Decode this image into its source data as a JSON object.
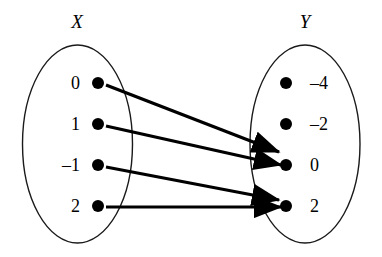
{
  "diagram": {
    "type": "mapping-diagram",
    "background_color": "#ffffff",
    "stroke_color": "#1a1a1a",
    "ink_color": "#000000",
    "sets": [
      {
        "key": "X",
        "title": "X",
        "title_x": 77,
        "title_y": 28,
        "ellipse": {
          "cx": 77.5,
          "cy": 144,
          "rx": 55,
          "ry": 99
        },
        "label_x": 80,
        "dot_x": 98,
        "dot_r": 6,
        "elements": [
          {
            "label": "0",
            "y": 83
          },
          {
            "label": "1",
            "y": 124
          },
          {
            "label": "–1",
            "y": 165
          },
          {
            "label": "2",
            "y": 206
          }
        ]
      },
      {
        "key": "Y",
        "title": "Y",
        "title_x": 305,
        "title_y": 28,
        "ellipse": {
          "cx": 305,
          "cy": 144,
          "rx": 55,
          "ry": 99
        },
        "label_x": 310,
        "dot_x": 286,
        "dot_r": 6,
        "elements": [
          {
            "label": "–4",
            "y": 83
          },
          {
            "label": "–2",
            "y": 124
          },
          {
            "label": "0",
            "y": 165
          },
          {
            "label": "2",
            "y": 206
          }
        ]
      }
    ],
    "arrows": [
      {
        "name": "arrow-0-to-0",
        "from": "0",
        "to": "0",
        "x1": 106,
        "y1": 85,
        "x2": 279,
        "y2": 152
      },
      {
        "name": "arrow-1-to-0",
        "from": "1",
        "to": "0",
        "x1": 106,
        "y1": 126,
        "x2": 281,
        "y2": 165
      },
      {
        "name": "arrow-neg1-to-2",
        "from": "–1",
        "to": "2",
        "x1": 106,
        "y1": 167,
        "x2": 279,
        "y2": 200
      },
      {
        "name": "arrow-2-to-2",
        "from": "2",
        "to": "2",
        "x1": 106,
        "y1": 207,
        "x2": 281,
        "y2": 207
      }
    ]
  },
  "chart_data": {
    "type": "diagram",
    "domain_set": {
      "name": "X",
      "values": [
        "0",
        "1",
        "-1",
        "2"
      ]
    },
    "codomain_set": {
      "name": "Y",
      "values": [
        "-4",
        "-2",
        "0",
        "2"
      ]
    },
    "mappings": [
      {
        "input": "0",
        "output": "0"
      },
      {
        "input": "1",
        "output": "0"
      },
      {
        "input": "-1",
        "output": "2"
      },
      {
        "input": "2",
        "output": "2"
      }
    ],
    "unmapped_outputs": [
      "-4",
      "-2"
    ]
  }
}
